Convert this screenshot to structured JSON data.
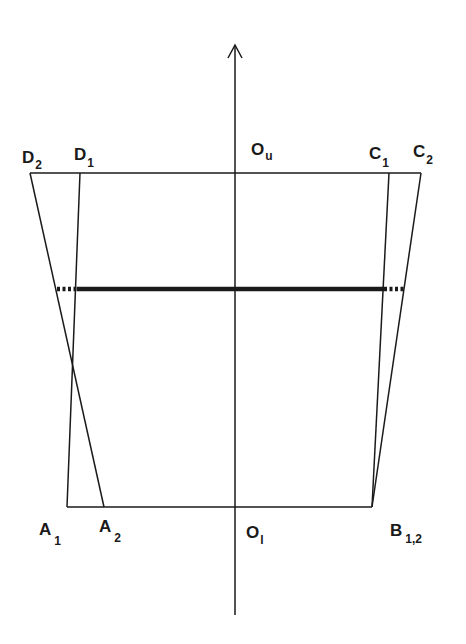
{
  "diagram": {
    "type": "geometric-construction",
    "axis": {
      "x": 235,
      "y_top": 45,
      "y_bottom": 615,
      "arrow": "up"
    },
    "points": {
      "D2": {
        "x": 30,
        "y": 173
      },
      "D1": {
        "x": 80,
        "y": 173
      },
      "Ou": {
        "x": 235,
        "y": 173
      },
      "C1": {
        "x": 389,
        "y": 173
      },
      "C2": {
        "x": 421,
        "y": 173
      },
      "A1": {
        "x": 67,
        "y": 507
      },
      "A2": {
        "x": 104,
        "y": 507
      },
      "Ol": {
        "x": 235,
        "y": 507
      },
      "B12": {
        "x": 372,
        "y": 507
      }
    },
    "labels": {
      "D2": {
        "main": "D",
        "sub": "2"
      },
      "D1": {
        "main": "D",
        "sub": "1"
      },
      "Ou": {
        "main": "O",
        "sub": "u"
      },
      "C1": {
        "main": "C",
        "sub": "1"
      },
      "C2": {
        "main": "C",
        "sub": "2"
      },
      "A1": {
        "main": "A",
        "sub": "1"
      },
      "A2": {
        "main": "A",
        "sub": "2"
      },
      "Ol": {
        "main": "O",
        "sub": "l"
      },
      "B12": {
        "main": "B",
        "sub": "1,2"
      }
    },
    "midline": {
      "y": 289,
      "solid_from": 77,
      "solid_to": 384,
      "dotted_left_from": 57,
      "dotted_right_to": 404
    },
    "colors": {
      "line": "#1a1a1a",
      "background": "#ffffff"
    }
  }
}
